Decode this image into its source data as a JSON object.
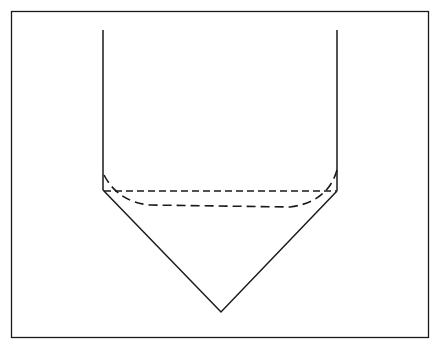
{
  "diagram": {
    "type": "vessel-cross-section",
    "background": "#ffffff",
    "stroke_color": "#1a1a1a",
    "frame": {
      "x": 11,
      "y": 11,
      "width": 418,
      "height": 327
    },
    "vessel": {
      "left_wall": {
        "x": 103,
        "y_top": 30,
        "y_bottom": 190
      },
      "right_wall": {
        "x": 337,
        "y_top": 30,
        "y_bottom": 191
      },
      "cone_apex": {
        "x": 221,
        "y": 312
      }
    },
    "dashed_lines": {
      "straight_level": {
        "y": 191,
        "x_start": 103,
        "x_end": 337
      },
      "curved_meniscus": {
        "left": {
          "x": 104,
          "y": 175
        },
        "bottom_y": 207,
        "right": {
          "x": 337,
          "y": 170
        }
      }
    },
    "text_labels": []
  }
}
